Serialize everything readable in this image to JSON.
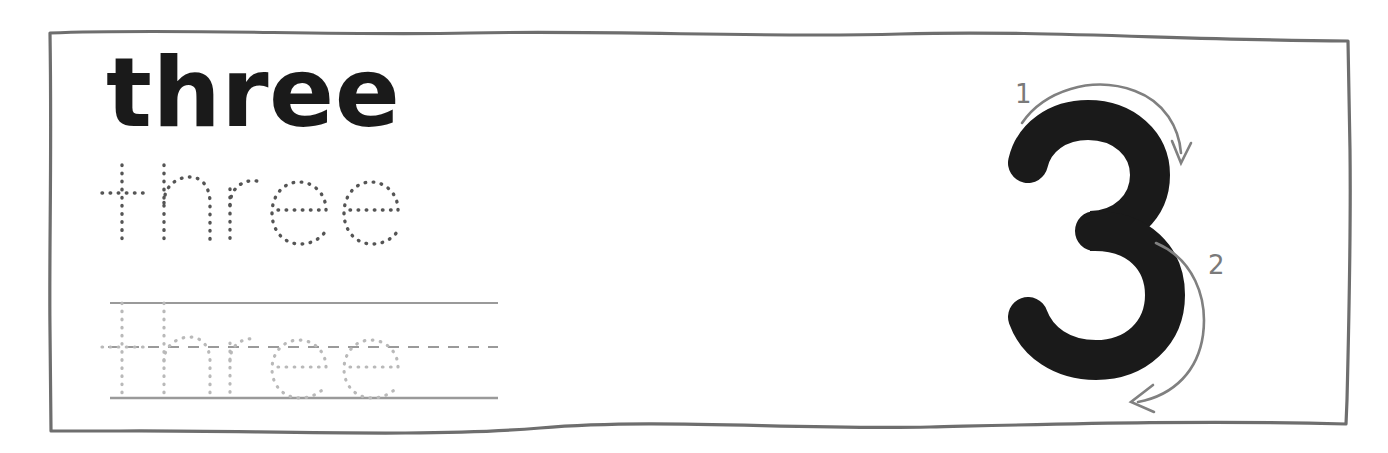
{
  "worksheet": {
    "title": "three",
    "numeral": "3",
    "border_color": "#6e6e6e",
    "background_color": "#ffffff"
  },
  "word_practice": {
    "bold_word": "three",
    "bold_word_color": "#1a1a1a",
    "trace_word_dark": "three",
    "trace_word_dark_color": "#555555",
    "trace_word_light": "three",
    "trace_word_light_color": "#b9b9b9",
    "guide_lines": {
      "top_line_style": "solid",
      "middle_line_style": "dashed",
      "bottom_line_style": "solid",
      "line_color": "#9a9a9a"
    }
  },
  "numeral_practice": {
    "numeral": "3",
    "numeral_color": "#1a1a1a",
    "stroke_order": [
      {
        "label": "1",
        "direction": "clockwise-top-arc",
        "arrow_end": "down"
      },
      {
        "label": "2",
        "direction": "clockwise-bottom-arc",
        "arrow_end": "left"
      }
    ],
    "arrow_color": "#808080",
    "label_color": "#7a7a7a"
  }
}
